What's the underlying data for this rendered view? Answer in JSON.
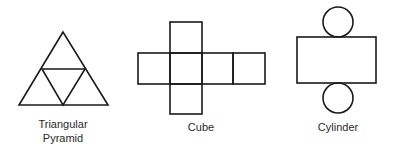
{
  "figure": {
    "nets": [
      {
        "id": "triangular-pyramid",
        "label_line1": "Triangular",
        "label_line2": "Pyramid"
      },
      {
        "id": "cube",
        "label": "Cube"
      },
      {
        "id": "cylinder",
        "label": "Cylinder"
      }
    ]
  },
  "colors": {
    "background": "#ffffff",
    "stroke": "#1a1a1a",
    "text": "#2a2a2a"
  }
}
